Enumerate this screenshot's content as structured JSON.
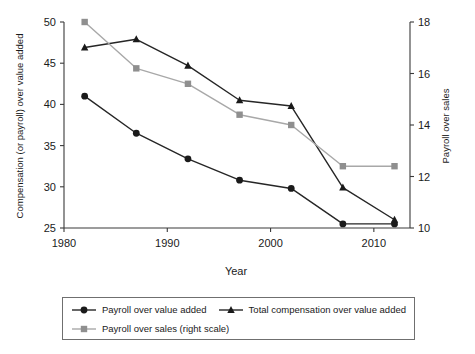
{
  "chart_data": {
    "type": "line",
    "title": "",
    "xlabel": "Year",
    "ylabel": "Compensation (or payroll) over value added",
    "y2label": "Payroll over sales",
    "x": [
      1982,
      1987,
      1992,
      1997,
      2002,
      2007,
      2012
    ],
    "xlim": [
      1980.0,
      2013.5
    ],
    "xticks": [
      1980,
      1990,
      2000,
      2010
    ],
    "xticklabels": [
      "1980",
      "1990",
      "2000",
      "2010"
    ],
    "ylim": [
      25,
      50
    ],
    "yticks": [
      25,
      30,
      35,
      40,
      45,
      50
    ],
    "yticklabels": [
      "25",
      "30",
      "35",
      "40",
      "45",
      "50"
    ],
    "y2lim": [
      10,
      18
    ],
    "y2ticks": [
      10,
      12,
      14,
      16,
      18
    ],
    "y2ticklabels": [
      "10",
      "12",
      "14",
      "16",
      "18"
    ],
    "grid": false,
    "legend_position": "below-plot",
    "series": [
      {
        "name": "Payroll over value added",
        "axis": "left",
        "marker": "circle",
        "color": "#262626",
        "marker_color": "#1a1a1a",
        "values": [
          41.0,
          36.5,
          33.4,
          30.8,
          29.8,
          25.5,
          25.5
        ]
      },
      {
        "name": "Total compensation over value added",
        "axis": "left",
        "marker": "triangle",
        "color": "#262626",
        "marker_color": "#1a1a1a",
        "values": [
          46.9,
          47.9,
          44.7,
          40.5,
          39.8,
          29.9,
          26.0
        ]
      },
      {
        "name": "Payroll over sales (right scale)",
        "axis": "right",
        "marker": "square",
        "color": "#a8a8a8",
        "marker_color": "#8f8f8f",
        "values": [
          18.0,
          16.2,
          15.6,
          14.4,
          14.0,
          12.4,
          12.4
        ]
      }
    ]
  },
  "legend": {
    "entries": [
      {
        "label": "Payroll over value added",
        "marker": "circle",
        "color": "#262626",
        "marker_color": "#1a1a1a"
      },
      {
        "label": "Total compensation over value added",
        "marker": "triangle",
        "color": "#262626",
        "marker_color": "#1a1a1a"
      },
      {
        "label": "Payroll over sales (right scale)",
        "marker": "square",
        "color": "#a8a8a8",
        "marker_color": "#8f8f8f"
      }
    ]
  }
}
